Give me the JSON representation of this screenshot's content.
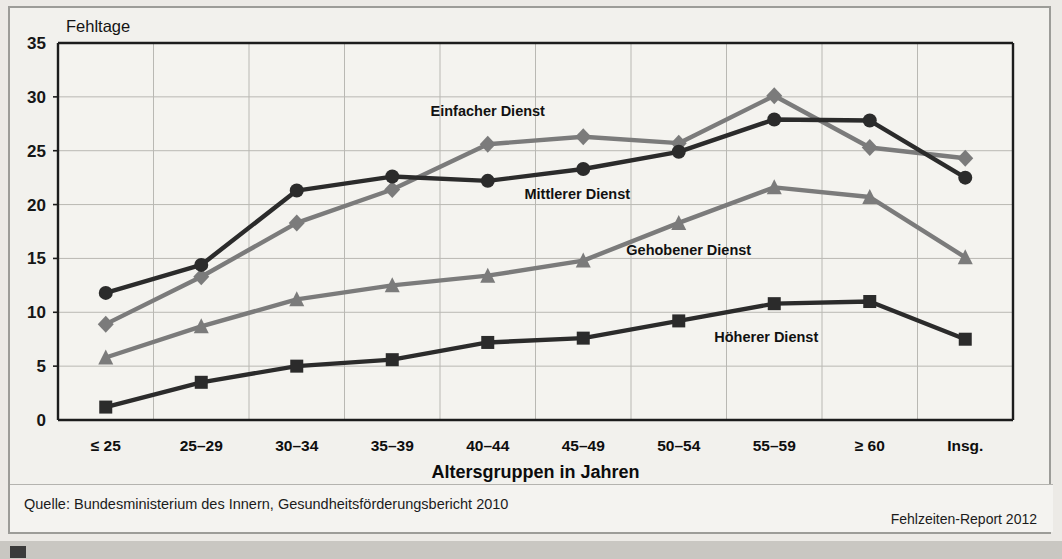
{
  "figure": {
    "y_axis_unit_label": "Fehltage",
    "x_axis_title": "Altersgruppen in Jahren",
    "source_text": "Quelle: Bundesministerium des Innern, Gesundheitsförderungsbericht 2010",
    "report_text": "Fehlzeiten-Report 2012"
  },
  "colors": {
    "dark_line": "#2b2b2b",
    "gray_line": "#7b7b7b",
    "plot_border": "#1c1c1c",
    "gridline": "#b9b8b3",
    "card_bg": "#f2f1ed",
    "page_bg": "#eceae6"
  },
  "chart_data": {
    "type": "line",
    "title": "",
    "subtitle": "",
    "xlabel": "Altersgruppen in Jahren",
    "ylabel": "Fehltage",
    "ylim": [
      0,
      35
    ],
    "yticks": [
      0,
      5,
      10,
      15,
      20,
      25,
      30,
      35
    ],
    "grid": true,
    "legend_position": "inline-annotations",
    "categories": [
      "≤ 25",
      "25–29",
      "30–34",
      "35–39",
      "40–44",
      "45–49",
      "50–54",
      "55–59",
      "≥ 60",
      "Insg."
    ],
    "series": [
      {
        "name": "Einfacher Dienst",
        "marker": "diamond",
        "color": "#7b7b7b",
        "values": [
          8.9,
          13.3,
          18.3,
          21.4,
          25.6,
          26.3,
          25.7,
          30.1,
          25.3,
          24.3
        ]
      },
      {
        "name": "Mittlerer Dienst",
        "marker": "circle",
        "color": "#2b2b2b",
        "values": [
          11.8,
          14.4,
          21.3,
          22.6,
          22.2,
          23.3,
          24.9,
          27.9,
          27.8,
          22.5
        ]
      },
      {
        "name": "Gehobener Dienst",
        "marker": "triangle",
        "color": "#7b7b7b",
        "values": [
          5.8,
          8.7,
          11.2,
          12.5,
          13.4,
          14.8,
          18.3,
          21.6,
          20.7,
          15.1
        ]
      },
      {
        "name": "Höherer Dienst",
        "marker": "square",
        "color": "#2b2b2b",
        "values": [
          1.2,
          3.5,
          5.0,
          5.6,
          7.2,
          7.6,
          9.2,
          10.8,
          11.0,
          7.5
        ]
      }
    ],
    "annotations": [
      {
        "text": "Einfacher Dienst",
        "series": 0,
        "at_category_index": 4,
        "offset_x": 0,
        "offset_y": -28
      },
      {
        "text": "Mittlerer Dienst",
        "series": 1,
        "at_category_index": 5,
        "offset_x": -6,
        "offset_y": 30
      },
      {
        "text": "Gehobener Dienst",
        "series": 2,
        "at_category_index": 6,
        "offset_x": 10,
        "offset_y": 32
      },
      {
        "text": "Höherer Dienst",
        "series": 3,
        "at_category_index": 7,
        "offset_x": -8,
        "offset_y": 38
      }
    ]
  }
}
